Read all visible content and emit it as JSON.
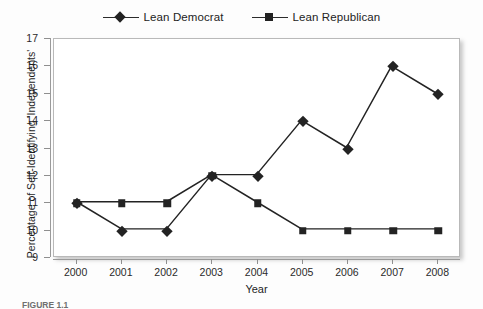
{
  "chart_data": {
    "type": "line",
    "title": "",
    "xlabel": "Year",
    "ylabel": "Percentage of Self-Identifying 'Independents'",
    "categories": [
      "2000",
      "2001",
      "2002",
      "2003",
      "2004",
      "2005",
      "2006",
      "2007",
      "2008"
    ],
    "x": [
      2000,
      2001,
      2002,
      2003,
      2004,
      2005,
      2006,
      2007,
      2008
    ],
    "series": [
      {
        "name": "Lean Democrat",
        "marker": "diamond",
        "color": "#232323",
        "values": [
          11,
          10,
          10,
          12,
          12,
          14,
          13,
          16,
          15
        ]
      },
      {
        "name": "Lean Republican",
        "marker": "square",
        "color": "#232323",
        "values": [
          11,
          11,
          11,
          12,
          11,
          10,
          10,
          10,
          10
        ]
      }
    ],
    "ylim": [
      9,
      17
    ],
    "yticks": [
      9,
      10,
      11,
      12,
      13,
      14,
      15,
      16,
      17
    ],
    "xlim": [
      2000,
      2008
    ],
    "grid": false,
    "legend_position": "top-center"
  },
  "legend": {
    "entries": [
      {
        "label": "Lean Democrat",
        "marker": "diamond"
      },
      {
        "label": "Lean Republican",
        "marker": "square"
      }
    ]
  },
  "axes": {
    "y_title": "Percentage of Self-Identifying 'Independents'",
    "x_title": "Year"
  },
  "caption": {
    "text": "FIGURE 1.1"
  }
}
